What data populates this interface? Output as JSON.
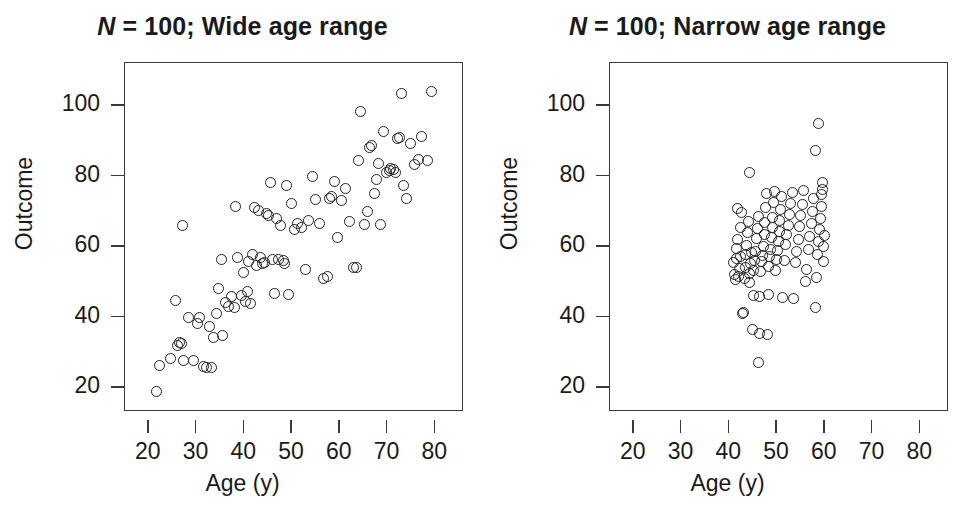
{
  "figure": {
    "type": "scatter-pair",
    "background": "#ffffff",
    "point_color": "#222222"
  },
  "chart_data": [
    {
      "type": "scatter",
      "panel": "left",
      "title": "N = 100; Wide age range",
      "title_prefix_italic": "N",
      "title_rest": " = 100; Wide age range",
      "xlabel": "Age (y)",
      "ylabel": "Outcome",
      "xlim": [
        15,
        86
      ],
      "ylim": [
        13,
        112
      ],
      "xticks": [
        20,
        30,
        40,
        50,
        60,
        70,
        80
      ],
      "yticks": [
        20,
        40,
        60,
        80,
        100
      ],
      "grid": false,
      "legend": null,
      "n": 100,
      "marker": "open-circle",
      "points": [
        [
          21.5,
          18.7
        ],
        [
          22.3,
          26.2
        ],
        [
          24.6,
          28.2
        ],
        [
          25.6,
          44.5
        ],
        [
          25.9,
          31.9
        ],
        [
          26.4,
          32.8
        ],
        [
          26.8,
          32.4
        ],
        [
          27.2,
          27.6
        ],
        [
          27.0,
          66.0
        ],
        [
          28.4,
          39.8
        ],
        [
          29.3,
          27.7
        ],
        [
          30.1,
          38.2
        ],
        [
          30.6,
          39.9
        ],
        [
          31.4,
          25.9
        ],
        [
          32.0,
          25.6
        ],
        [
          33.1,
          25.5
        ],
        [
          32.6,
          37.2
        ],
        [
          33.5,
          34.2
        ],
        [
          34.2,
          40.8
        ],
        [
          34.6,
          48.1
        ],
        [
          35.4,
          34.6
        ],
        [
          36.0,
          44.1
        ],
        [
          35.2,
          56.3
        ],
        [
          36.6,
          42.8
        ],
        [
          37.3,
          45.7
        ],
        [
          37.9,
          42.6
        ],
        [
          38.6,
          56.8
        ],
        [
          38.1,
          71.4
        ],
        [
          39.4,
          46.1
        ],
        [
          39.8,
          52.6
        ],
        [
          40.2,
          44.3
        ],
        [
          40.6,
          47.3
        ],
        [
          40.9,
          55.7
        ],
        [
          41.3,
          43.9
        ],
        [
          41.7,
          57.7
        ],
        [
          42.1,
          71.0
        ],
        [
          42.6,
          54.6
        ],
        [
          42.9,
          70.2
        ],
        [
          43.4,
          56.9
        ],
        [
          43.8,
          55.1
        ],
        [
          44.2,
          55.3
        ],
        [
          44.6,
          69.3
        ],
        [
          45.1,
          68.6
        ],
        [
          45.5,
          78.0
        ],
        [
          45.9,
          56.2
        ],
        [
          46.3,
          46.6
        ],
        [
          46.8,
          67.8
        ],
        [
          47.2,
          56.4
        ],
        [
          47.6,
          66.0
        ],
        [
          48.1,
          55.9
        ],
        [
          48.4,
          55.0
        ],
        [
          48.9,
          77.3
        ],
        [
          49.3,
          46.4
        ],
        [
          49.8,
          72.1
        ],
        [
          50.4,
          64.9
        ],
        [
          51.2,
          66.4
        ],
        [
          52.0,
          65.2
        ],
        [
          52.8,
          53.4
        ],
        [
          53.5,
          67.2
        ],
        [
          54.3,
          79.9
        ],
        [
          55.0,
          73.4
        ],
        [
          55.8,
          66.5
        ],
        [
          56.6,
          51.0
        ],
        [
          57.4,
          51.4
        ],
        [
          57.9,
          73.6
        ],
        [
          58.2,
          74.1
        ],
        [
          58.9,
          78.5
        ],
        [
          59.6,
          62.5
        ],
        [
          60.4,
          73.0
        ],
        [
          61.2,
          76.3
        ],
        [
          62.0,
          67.1
        ],
        [
          62.8,
          53.9
        ],
        [
          63.4,
          54.1
        ],
        [
          63.9,
          84.4
        ],
        [
          64.3,
          98.3
        ],
        [
          65.1,
          66.1
        ],
        [
          65.8,
          69.8
        ],
        [
          66.3,
          87.9
        ],
        [
          66.7,
          88.6
        ],
        [
          67.2,
          74.9
        ],
        [
          67.6,
          79.0
        ],
        [
          68.1,
          83.5
        ],
        [
          68.6,
          66.1
        ],
        [
          69.2,
          92.6
        ],
        [
          69.8,
          80.9
        ],
        [
          70.3,
          81.6
        ],
        [
          70.7,
          82.1
        ],
        [
          71.2,
          81.8
        ],
        [
          71.6,
          81.0
        ],
        [
          72.0,
          90.6
        ],
        [
          72.5,
          91.0
        ],
        [
          72.9,
          103.4
        ],
        [
          73.4,
          77.2
        ],
        [
          74.0,
          73.6
        ],
        [
          74.8,
          89.1
        ],
        [
          75.6,
          83.2
        ],
        [
          76.4,
          84.6
        ],
        [
          77.2,
          91.1
        ],
        [
          78.3,
          84.3
        ],
        [
          79.1,
          104.0
        ]
      ]
    },
    {
      "type": "scatter",
      "panel": "right",
      "title": "N = 100; Narrow age range",
      "title_prefix_italic": "N",
      "title_rest": " = 100; Narrow age range",
      "xlabel": "Age (y)",
      "ylabel": "Outcome",
      "xlim": [
        15,
        86
      ],
      "ylim": [
        13,
        112
      ],
      "xticks": [
        20,
        30,
        40,
        50,
        60,
        70,
        80
      ],
      "yticks": [
        20,
        40,
        60,
        80,
        100
      ],
      "grid": false,
      "legend": null,
      "n": 100,
      "marker": "open-circle",
      "points": [
        [
          40.8,
          55.5
        ],
        [
          41.0,
          52.0
        ],
        [
          41.2,
          50.5
        ],
        [
          41.4,
          56.6
        ],
        [
          41.5,
          59.5
        ],
        [
          41.7,
          62.0
        ],
        [
          41.8,
          70.8
        ],
        [
          42.0,
          51.4
        ],
        [
          42.1,
          53.6
        ],
        [
          42.3,
          57.0
        ],
        [
          42.4,
          65.2
        ],
        [
          42.6,
          69.7
        ],
        [
          42.8,
          41.0
        ],
        [
          43.0,
          41.2
        ],
        [
          43.1,
          50.8
        ],
        [
          43.3,
          54.1
        ],
        [
          43.4,
          57.6
        ],
        [
          43.6,
          60.3
        ],
        [
          43.8,
          63.8
        ],
        [
          44.0,
          67.0
        ],
        [
          44.2,
          49.8
        ],
        [
          44.3,
          52.4
        ],
        [
          44.5,
          55.0
        ],
        [
          44.6,
          58.2
        ],
        [
          44.8,
          36.4
        ],
        [
          45.0,
          46.0
        ],
        [
          45.1,
          53.1
        ],
        [
          45.3,
          56.0
        ],
        [
          45.4,
          58.6
        ],
        [
          45.6,
          62.2
        ],
        [
          45.8,
          65.0
        ],
        [
          46.0,
          68.5
        ],
        [
          46.1,
          27.0
        ],
        [
          46.3,
          35.2
        ],
        [
          46.4,
          45.8
        ],
        [
          46.6,
          52.8
        ],
        [
          46.8,
          55.6
        ],
        [
          47.0,
          57.4
        ],
        [
          47.1,
          60.0
        ],
        [
          47.3,
          63.3
        ],
        [
          47.4,
          66.8
        ],
        [
          47.6,
          71.0
        ],
        [
          47.8,
          75.0
        ],
        [
          48.0,
          35.0
        ],
        [
          48.1,
          46.2
        ],
        [
          48.3,
          54.4
        ],
        [
          48.4,
          57.0
        ],
        [
          48.6,
          59.2
        ],
        [
          48.8,
          62.6
        ],
        [
          49.0,
          65.4
        ],
        [
          49.1,
          68.2
        ],
        [
          49.3,
          72.5
        ],
        [
          49.4,
          75.6
        ],
        [
          49.6,
          53.0
        ],
        [
          49.8,
          56.4
        ],
        [
          50.0,
          58.8
        ],
        [
          50.2,
          61.5
        ],
        [
          50.4,
          64.2
        ],
        [
          50.6,
          67.4
        ],
        [
          50.8,
          70.4
        ],
        [
          51.0,
          74.0
        ],
        [
          51.2,
          45.5
        ],
        [
          51.5,
          56.0
        ],
        [
          51.8,
          60.6
        ],
        [
          52.0,
          63.4
        ],
        [
          52.3,
          66.0
        ],
        [
          52.6,
          69.0
        ],
        [
          52.9,
          72.2
        ],
        [
          53.2,
          75.4
        ],
        [
          53.5,
          45.2
        ],
        [
          53.8,
          55.3
        ],
        [
          54.1,
          58.4
        ],
        [
          54.4,
          62.0
        ],
        [
          54.7,
          65.6
        ],
        [
          55.0,
          68.8
        ],
        [
          55.3,
          72.0
        ],
        [
          55.6,
          75.8
        ],
        [
          55.9,
          50.0
        ],
        [
          56.2,
          53.4
        ],
        [
          56.5,
          59.0
        ],
        [
          56.8,
          62.8
        ],
        [
          57.1,
          66.4
        ],
        [
          57.4,
          70.0
        ],
        [
          57.7,
          73.6
        ],
        [
          58.0,
          42.6
        ],
        [
          58.2,
          51.2
        ],
        [
          58.4,
          57.8
        ],
        [
          58.6,
          61.4
        ],
        [
          58.8,
          64.8
        ],
        [
          59.0,
          68.0
        ],
        [
          59.2,
          71.4
        ],
        [
          59.4,
          74.8
        ],
        [
          59.6,
          78.0
        ],
        [
          59.8,
          60.0
        ],
        [
          59.9,
          63.0
        ],
        [
          44.3,
          80.8
        ],
        [
          58.1,
          87.2
        ],
        [
          58.6,
          94.8
        ],
        [
          59.5,
          76.2
        ],
        [
          59.7,
          55.8
        ]
      ]
    }
  ]
}
